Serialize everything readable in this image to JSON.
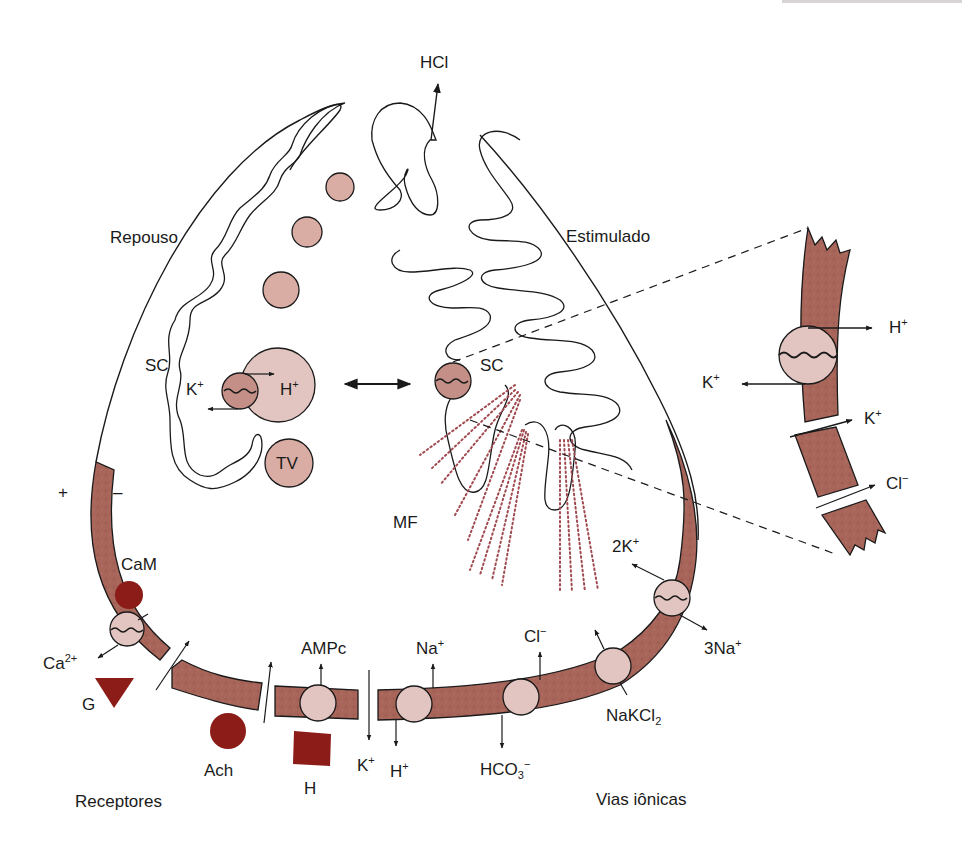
{
  "colors": {
    "membrane": "#a8655a",
    "membrane_dark": "#8d4d43",
    "pump_fill": "#e2c5c0",
    "vesicle_fill": "#d9aca4",
    "ligand": "#8b1c17",
    "microfilament_dots": "#a04a50",
    "outline": "#1a1a1a"
  },
  "states": {
    "resting": "Repouso",
    "stimulated": "Estimulado"
  },
  "secretion": {
    "product": "HCl"
  },
  "structures": {
    "canaliculus_resting": "SC",
    "canaliculus_stimulated": "SC",
    "tubulovesicle": "TV",
    "microfilaments": "MF"
  },
  "resting_pump": {
    "ion_in": "K",
    "ion_in_charge": "+",
    "ion_out": "H",
    "ion_out_charge": "+"
  },
  "polarity": {
    "plus": "+",
    "minus": "–"
  },
  "receptors": {
    "section_label": "Receptores",
    "items": [
      {
        "label": "CaM",
        "shape": "circle"
      },
      {
        "label": "G",
        "shape": "triangle"
      },
      {
        "label": "Ach",
        "shape": "circle"
      },
      {
        "label": "H",
        "shape": "square"
      }
    ],
    "ca_label": "Ca",
    "ca_charge": "2+",
    "camp_label": "AMPc"
  },
  "ion_pathways": {
    "section_label": "Vias iônicas",
    "k_channel": {
      "label": "K",
      "charge": "+"
    },
    "na_h_exchanger": {
      "in": "Na",
      "in_charge": "+",
      "out": "H",
      "out_charge": "+"
    },
    "cl_hco3_exchanger": {
      "in": "Cl",
      "in_charge": "−",
      "out": "HCO",
      "out_sub": "3",
      "out_charge": "−"
    },
    "cotransporter": {
      "label": "NaKCl",
      "label_sub": "2"
    },
    "na_k_atpase": {
      "in": "2K",
      "in_charge": "+",
      "out": "3Na",
      "out_charge": "+"
    }
  },
  "zoom_inset": {
    "pump": {
      "out": "H",
      "out_charge": "+",
      "in": "K",
      "in_charge": "+"
    },
    "k_channel": {
      "label": "K",
      "charge": "+"
    },
    "cl_channel": {
      "label": "Cl",
      "charge": "−"
    }
  }
}
